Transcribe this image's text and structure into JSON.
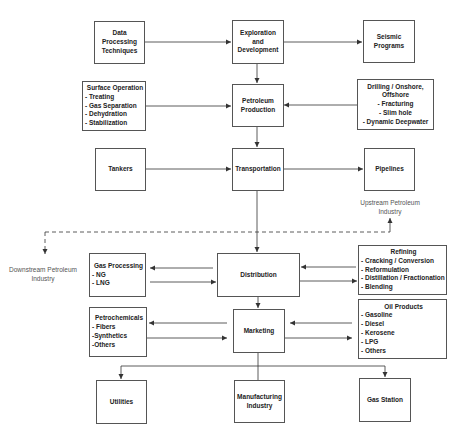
{
  "diagram": {
    "nodes": {
      "data_processing": {
        "label": "Data Processing Techniques"
      },
      "exploration": {
        "label": "Exploration and Development"
      },
      "seismic": {
        "label": "Seismic Programs"
      },
      "surface_operation": {
        "title": "Surface Operation",
        "items": [
          "- Treating",
          "- Gas Separation",
          "- Dehydration",
          "- Stabilization"
        ]
      },
      "petroleum_production": {
        "label": "Petroleum Production"
      },
      "drilling": {
        "lines": [
          "Drilling / Onshore,",
          "Offshore",
          "- Fracturing",
          "- Slim hole",
          "- Dynamic Deepwater"
        ]
      },
      "tankers": {
        "label": "Tankers"
      },
      "transportation": {
        "label": "Transportation"
      },
      "pipelines": {
        "label": "Pipelines"
      },
      "gas_processing": {
        "title": "Gas Processing",
        "items": [
          "- NG",
          "- LNG"
        ]
      },
      "distribution": {
        "label": "Distribution"
      },
      "refining": {
        "title": "Refining",
        "items": [
          "- Cracking / Conversion",
          "- Reformulation",
          "- Distillation / Fractionation",
          "- Blending"
        ]
      },
      "petrochemicals": {
        "title": "Petrochemicals",
        "items": [
          "- Fibers",
          "-Synthetics",
          "-Others"
        ]
      },
      "marketing": {
        "label": "Marketing"
      },
      "oil_products": {
        "title": "Oil Products",
        "items": [
          "- Gasoline",
          "- Diesel",
          "- Kerosene",
          "- LPG",
          "- Others"
        ]
      },
      "utilities": {
        "label": "Utilities"
      },
      "manufacturing": {
        "label": "Manufacturing Industry"
      },
      "gas_station": {
        "label": "Gas Station"
      }
    },
    "annotations": {
      "upstream": "Upstream Petroleum Industry",
      "downstream": "Downstream Petroleum Industry"
    },
    "edges": [
      {
        "from": "data_processing",
        "to": "exploration"
      },
      {
        "from": "exploration",
        "to": "seismic"
      },
      {
        "from": "exploration",
        "to": "petroleum_production"
      },
      {
        "from": "surface_operation",
        "to": "petroleum_production"
      },
      {
        "from": "drilling",
        "to": "petroleum_production"
      },
      {
        "from": "petroleum_production",
        "to": "transportation"
      },
      {
        "from": "tankers",
        "to": "transportation"
      },
      {
        "from": "transportation",
        "to": "pipelines"
      },
      {
        "from": "transportation",
        "to": "distribution"
      },
      {
        "from": "distribution",
        "to": "gas_processing"
      },
      {
        "from": "gas_processing",
        "to": "distribution"
      },
      {
        "from": "refining",
        "to": "distribution"
      },
      {
        "from": "distribution",
        "to": "refining"
      },
      {
        "from": "distribution",
        "to": "marketing"
      },
      {
        "from": "marketing",
        "to": "petrochemicals"
      },
      {
        "from": "petrochemicals",
        "to": "marketing"
      },
      {
        "from": "oil_products",
        "to": "marketing"
      },
      {
        "from": "marketing",
        "to": "oil_products"
      },
      {
        "from": "marketing",
        "to": "utilities"
      },
      {
        "from": "marketing",
        "to": "manufacturing"
      },
      {
        "from": "marketing",
        "to": "gas_station"
      }
    ]
  },
  "colors": {
    "line": "#333333",
    "border": "#555555",
    "text": "#222222",
    "note": "#555555"
  }
}
